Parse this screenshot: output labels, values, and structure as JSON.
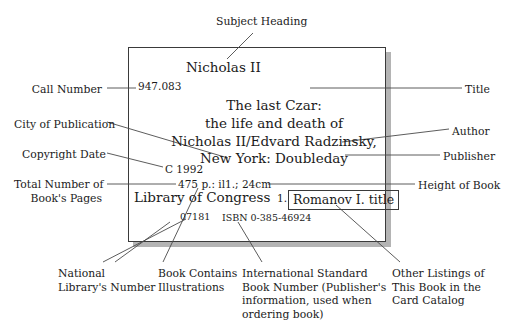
{
  "diagram": {
    "card": {
      "subject_heading": "Nicholas II",
      "call_number": "947.083",
      "title_block": "The last Czar:\nthe life and death of\nNicholas II/Edvard Radzinsky,\nNew York: Doubleday",
      "copyright_date": "C 1992",
      "pages_line": "475 p.: il1.; 24cm",
      "library_of_congress": "Library of Congress",
      "tracing_number": "1.",
      "tracing_entry": "Romanov I. title",
      "national_library_number": "07181",
      "isbn": "ISBN 0-385-46924"
    },
    "labels": {
      "subject_heading": "Subject Heading",
      "call_number": "Call Number",
      "city_of_publication": "City of Publication",
      "copyright_date": "Copyright Date",
      "total_pages": "Total Number of\nBook's Pages",
      "title": "Title",
      "author": "Author",
      "publisher": "Publisher",
      "height_of_book": "Height of Book",
      "national_library_number": "National\nLibrary's Number",
      "book_contains_illustrations": "Book Contains\nIllustrations",
      "isbn": "International Standard\nBook Number (Publisher's\ninformation, used when\nordering book)",
      "other_listings": "Other Listings of\nThis Book in the\nCard Catalog"
    },
    "colors": {
      "text": "#1b1b1b",
      "card_border": "#3a3a3a",
      "card_shadow": "#b4b4b4",
      "leader_line": "#4a4a4a",
      "background": "#ffffff"
    }
  }
}
